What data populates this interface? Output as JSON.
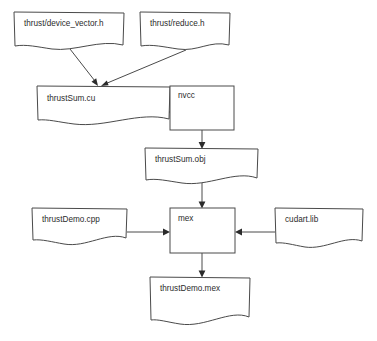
{
  "diagram": {
    "background_color": "#ffffff",
    "stroke_color": "#4a4a4a",
    "text_color": "#2b2b2b",
    "nodes": [
      {
        "id": "device_vector_h",
        "label": "thrust/device_vector.h",
        "shape": "document",
        "x": 14,
        "y": 12,
        "w": 110,
        "h": 34
      },
      {
        "id": "reduce_h",
        "label": "thrust/reduce.h",
        "shape": "document",
        "x": 140,
        "y": 12,
        "w": 90,
        "h": 34
      },
      {
        "id": "thrustsum_cu",
        "label": "thrustSum.cu",
        "shape": "document",
        "x": 37,
        "y": 86,
        "w": 133,
        "h": 34
      },
      {
        "id": "nvcc",
        "label": "nvcc",
        "shape": "rectangle",
        "x": 170,
        "y": 86,
        "w": 64,
        "h": 44
      },
      {
        "id": "thrustsum_obj",
        "label": "thrustSum.obj",
        "shape": "document",
        "x": 145,
        "y": 148,
        "w": 113,
        "h": 32
      },
      {
        "id": "thrustdemo_cpp",
        "label": "thrustDemo.cpp",
        "shape": "document",
        "x": 32,
        "y": 208,
        "w": 95,
        "h": 32
      },
      {
        "id": "mex",
        "label": "mex",
        "shape": "rectangle",
        "x": 170,
        "y": 208,
        "w": 65,
        "h": 45
      },
      {
        "id": "cudart_lib",
        "label": "cudart.lib",
        "shape": "document",
        "x": 275,
        "y": 208,
        "w": 88,
        "h": 34
      },
      {
        "id": "thrustdemo_mex",
        "label": "thrustDemo.mex",
        "shape": "document",
        "x": 150,
        "y": 277,
        "w": 100,
        "h": 44
      }
    ],
    "edges": [
      {
        "id": "e1",
        "from": "device_vector_h",
        "to": "thrustsum_cu",
        "arrow": "down-right"
      },
      {
        "id": "e2",
        "from": "reduce_h",
        "to": "thrustsum_cu",
        "arrow": "down-left"
      },
      {
        "id": "e3",
        "from": "thrustsum_cu",
        "to": "nvcc",
        "arrow": "right"
      },
      {
        "id": "e4",
        "from": "nvcc",
        "to": "thrustsum_obj",
        "arrow": "down"
      },
      {
        "id": "e5",
        "from": "thrustsum_obj",
        "to": "mex",
        "arrow": "down"
      },
      {
        "id": "e6",
        "from": "thrustdemo_cpp",
        "to": "mex",
        "arrow": "right"
      },
      {
        "id": "e7",
        "from": "cudart_lib",
        "to": "mex",
        "arrow": "left"
      },
      {
        "id": "e8",
        "from": "mex",
        "to": "thrustdemo_mex",
        "arrow": "down"
      }
    ]
  }
}
